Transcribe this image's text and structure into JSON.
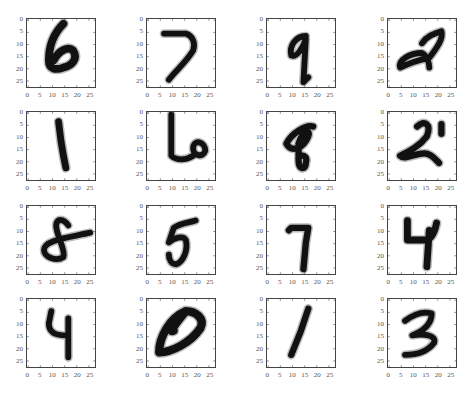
{
  "chart_data": {
    "type": "image-grid",
    "title": "",
    "rows": 4,
    "cols": 4,
    "image_size": [
      28,
      28
    ],
    "cmap": "gray_r",
    "xticks": [
      0,
      5,
      10,
      15,
      20,
      25
    ],
    "yticks": [
      0,
      5,
      10,
      15,
      20,
      25
    ],
    "tick_labels": [
      "0",
      "5",
      "10",
      "15",
      "20",
      "25"
    ],
    "digits": [
      [
        6,
        7,
        9,
        2
      ],
      [
        1,
        6,
        8,
        2
      ],
      [
        8,
        5,
        7,
        4
      ],
      [
        4,
        0,
        1,
        3
      ]
    ],
    "xlim": [
      0,
      27
    ],
    "ylim": [
      27,
      0
    ],
    "grid": false
  },
  "ticks": {
    "t0": "0",
    "t5": "5",
    "t10": "10",
    "t15": "15",
    "t20": "20",
    "t25": "25"
  }
}
